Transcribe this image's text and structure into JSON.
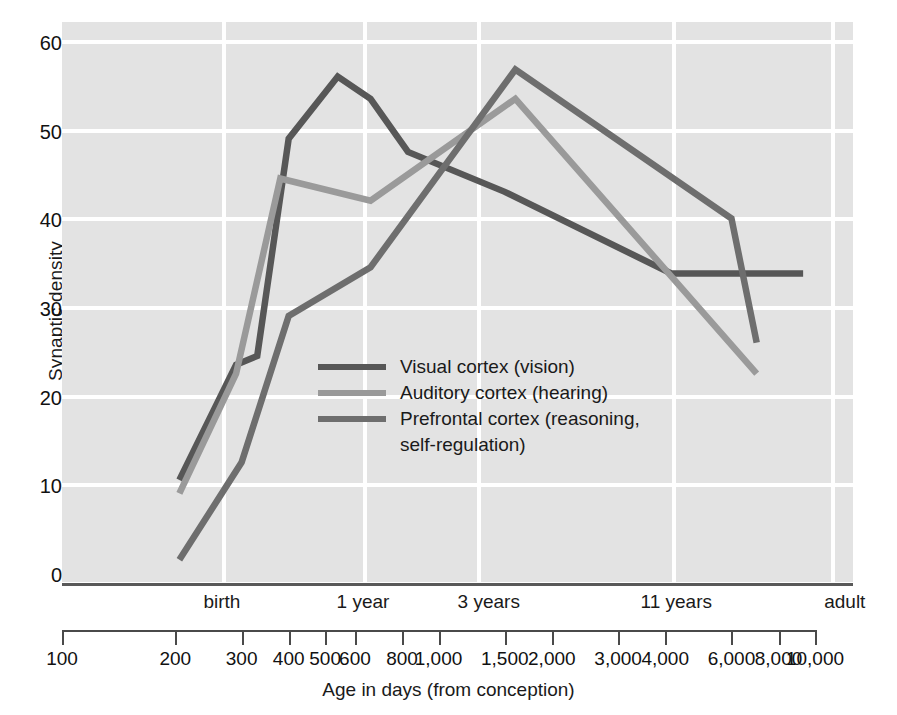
{
  "chart_data": {
    "type": "line",
    "title": "",
    "xlabel": "Age in days (from conception)",
    "ylabel": "Synaptic density",
    "xscale": "log",
    "xlim": [
      100,
      10000
    ],
    "ylim": [
      0,
      62
    ],
    "grid": true,
    "legend_position": "inside-center",
    "y_ticks": [
      60,
      50,
      40,
      30,
      20,
      10,
      0
    ],
    "x_ticks": [
      "100",
      "200",
      "300",
      "400",
      "500",
      "600",
      "800",
      "1,000",
      "1,500",
      "2,000",
      "3,000",
      "4,000",
      "6,000",
      "8,000",
      "10,000"
    ],
    "x_tick_values": [
      100,
      200,
      300,
      400,
      500,
      600,
      800,
      1000,
      1500,
      2000,
      3000,
      4000,
      6000,
      8000,
      10000
    ],
    "age_labels": [
      {
        "label": "birth",
        "days": 266
      },
      {
        "label": "1 year",
        "days": 630
      },
      {
        "label": "3 years",
        "days": 1360
      },
      {
        "label": "11 years",
        "days": 4280
      },
      {
        "label": "adult",
        "days": 12000
      }
    ],
    "age_gridline_days": [
      266,
      630,
      1265,
      4175,
      11000
    ],
    "series": [
      {
        "name": "Visual cortex (vision)",
        "color": "#575757",
        "points": [
          {
            "x": 205,
            "y": 11.5
          },
          {
            "x": 290,
            "y": 24.5
          },
          {
            "x": 330,
            "y": 25.5
          },
          {
            "x": 400,
            "y": 50.0
          },
          {
            "x": 540,
            "y": 57.0
          },
          {
            "x": 660,
            "y": 54.5
          },
          {
            "x": 830,
            "y": 48.5
          },
          {
            "x": 1500,
            "y": 44.0
          },
          {
            "x": 4150,
            "y": 34.8
          },
          {
            "x": 9300,
            "y": 34.8
          }
        ]
      },
      {
        "name": "Auditory cortex (hearing)",
        "color": "#9a9a9a",
        "points": [
          {
            "x": 205,
            "y": 10.0
          },
          {
            "x": 290,
            "y": 23.5
          },
          {
            "x": 380,
            "y": 45.5
          },
          {
            "x": 660,
            "y": 43.0
          },
          {
            "x": 1600,
            "y": 54.5
          },
          {
            "x": 7000,
            "y": 23.5
          }
        ]
      },
      {
        "name": "Prefrontal cortex (reasoning, self-regulation)",
        "color": "#6e6e6e",
        "points": [
          {
            "x": 205,
            "y": 2.5
          },
          {
            "x": 300,
            "y": 13.5
          },
          {
            "x": 400,
            "y": 30.0
          },
          {
            "x": 660,
            "y": 35.5
          },
          {
            "x": 1600,
            "y": 57.8
          },
          {
            "x": 6000,
            "y": 41.0
          },
          {
            "x": 7000,
            "y": 27.0
          }
        ]
      }
    ]
  },
  "legend": {
    "items": [
      {
        "label": "Visual cortex (vision)",
        "label2": "",
        "color": "#575757"
      },
      {
        "label": "Auditory cortex (hearing)",
        "label2": "",
        "color": "#9a9a9a"
      },
      {
        "label": "Prefrontal cortex (reasoning,",
        "label2": "self-regulation)",
        "color": "#6e6e6e"
      }
    ]
  },
  "axes": {
    "y_title": "Synaptic density",
    "x_title": "Age in days (from conception)"
  }
}
